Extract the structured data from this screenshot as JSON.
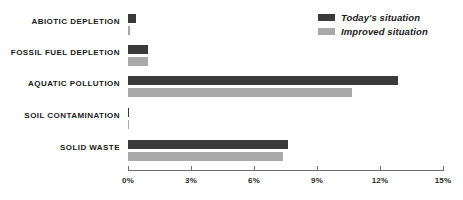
{
  "chart_data": {
    "type": "bar",
    "orientation": "horizontal",
    "title": "",
    "xlabel": "",
    "ylabel": "",
    "xlim": [
      0,
      15
    ],
    "xunit": "%",
    "grid": false,
    "legend_position": "top-right",
    "categories": [
      "ABIOTIC DEPLETION",
      "FOSSIL FUEL DEPLETION",
      "AQUATIC POLLUTION",
      "SOIL CONTAMINATION",
      "SOLID WASTE"
    ],
    "tick_labels": [
      "0%",
      "3%",
      "6%",
      "9%",
      "12%",
      "15%"
    ],
    "tick_values": [
      0,
      3,
      6,
      9,
      12,
      15
    ],
    "series": [
      {
        "name": "Today's situation",
        "color": "#3a3a3a",
        "values": [
          0.4,
          0.95,
          12.85,
          0.05,
          7.6
        ]
      },
      {
        "name": "Improved situation",
        "color": "#a9a9a9",
        "values": [
          0.1,
          0.95,
          10.65,
          0.05,
          7.4
        ]
      }
    ]
  },
  "legend": {
    "items": [
      {
        "label": "Today's situation"
      },
      {
        "label": "Improved situation"
      }
    ]
  },
  "colors": {
    "dark": "#3a3a3a",
    "light": "#a9a9a9",
    "axis": "#6e6e6e",
    "text": "#1a1a1a",
    "background": "#ffffff"
  }
}
